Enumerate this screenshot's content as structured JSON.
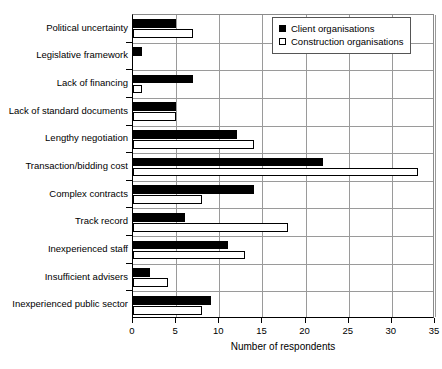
{
  "chart_data": {
    "type": "bar",
    "orientation": "horizontal",
    "title": "",
    "xlabel": "Number of respondents",
    "ylabel": "",
    "xlim": [
      0,
      35
    ],
    "xticks": [
      0,
      5,
      10,
      15,
      20,
      25,
      30,
      35
    ],
    "grid": true,
    "legend_position": "top-right",
    "categories": [
      "Political uncertainty",
      "Legislative framework",
      "Lack of financing",
      "Lack of standard documents",
      "Lengthy negotiation",
      "Transaction/bidding cost",
      "Complex contracts",
      "Track record",
      "Inexperienced staff",
      "Insufficient advisers",
      "Inexperienced public sector"
    ],
    "series": [
      {
        "name": "Client organisations",
        "color": "#000000",
        "fill": "solid",
        "values": [
          5,
          1,
          7,
          5,
          12,
          22,
          14,
          6,
          11,
          2,
          9
        ]
      },
      {
        "name": "Construction organisations",
        "color": "#ffffff",
        "fill": "hollow",
        "values": [
          7,
          0,
          1,
          5,
          14,
          33,
          8,
          18,
          13,
          4,
          8
        ]
      }
    ]
  },
  "legend": {
    "items": [
      {
        "label": "Client organisations",
        "swatch": "filled-square-icon"
      },
      {
        "label": "Construction organisations",
        "swatch": "hollow-square-icon"
      }
    ]
  },
  "axis": {
    "x_title": "Number of respondents",
    "tick_labels": [
      "0",
      "5",
      "10",
      "15",
      "20",
      "25",
      "30",
      "35"
    ]
  }
}
